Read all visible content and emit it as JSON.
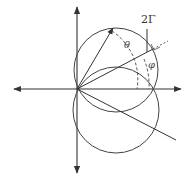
{
  "diagram": {
    "type": "geometric construction",
    "labels": {
      "two_gamma": "2Γ",
      "theta": "θ",
      "phi": "φ"
    },
    "colors": {
      "stroke": "#444444",
      "background": "#ffffff"
    },
    "elements": [
      "horizontal axis with arrows both ends",
      "vertical axis with arrows both ends",
      "upper circle through origin",
      "lower circle through origin",
      "vector arrow from origin",
      "line from origin with dashed extension",
      "line from origin downward-right",
      "vertical line labeled 2Γ with right-angle mark",
      "dashed arc theta",
      "dashed arc phi"
    ]
  }
}
